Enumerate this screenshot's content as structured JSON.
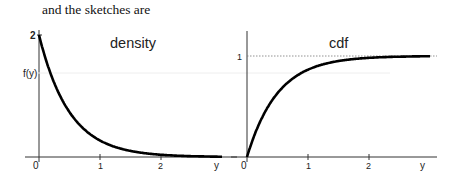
{
  "intro_text": "and the sketches are",
  "chart_data": [
    {
      "type": "line",
      "title": "density",
      "xlabel": "y",
      "ylabel": "f(y)",
      "x_ticks": [
        "0",
        "1",
        "2"
      ],
      "y_ticks": [
        "2"
      ],
      "function": "f(y) = 2e^{-2y}",
      "x": [
        0,
        0.25,
        0.5,
        0.75,
        1,
        1.5,
        2,
        2.5,
        3
      ],
      "values": [
        2,
        1.21,
        0.74,
        0.45,
        0.27,
        0.1,
        0.04,
        0.01,
        0.005
      ],
      "xlim": [
        0,
        3
      ],
      "ylim": [
        0,
        2
      ]
    },
    {
      "type": "line",
      "title": "cdf",
      "xlabel": "y",
      "ylabel": "",
      "x_ticks": [
        "0",
        "1",
        "2"
      ],
      "y_ticks": [
        "1"
      ],
      "function": "F(y) = 1 - e^{-2y}",
      "x": [
        0,
        0.25,
        0.5,
        0.75,
        1,
        1.5,
        2,
        2.5,
        3
      ],
      "values": [
        0,
        0.39,
        0.63,
        0.78,
        0.86,
        0.95,
        0.98,
        0.99,
        1.0
      ],
      "xlim": [
        0,
        3
      ],
      "ylim": [
        0,
        1
      ],
      "asymptote": 1
    }
  ],
  "labels": {
    "density_title": "density",
    "density_ylabel": "f(y)",
    "density_ytick": "2",
    "cdf_title": "cdf",
    "cdf_ytick": "1",
    "x0": "0",
    "x1": "1",
    "x2": "2",
    "xvar": "y"
  }
}
